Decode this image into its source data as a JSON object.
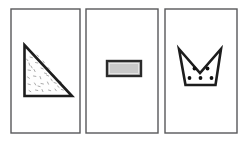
{
  "figure": {
    "background_color": "#ffffff",
    "panel_count": 3,
    "panel_border_color": "#58585a",
    "shape_stroke_color": "#1d1d1d",
    "panels": [
      {
        "index": 1,
        "shape_name": "right-triangle",
        "fill_label": "stippled",
        "fill_color": "#fefefe",
        "speck_color": "#9a9a9a",
        "vertices": "top-left, bottom-left, bottom-right",
        "dot_count": 0
      },
      {
        "index": 2,
        "shape_name": "horizontal-rectangle",
        "fill_label": "solid-gray",
        "fill_color": "#c9c9c9",
        "speck_color": "",
        "vertices": "four corners",
        "dot_count": 0
      },
      {
        "index": 3,
        "shape_name": "notched-cup",
        "fill_label": "white-with-dots",
        "fill_color": "#ffffff",
        "speck_color": "#101010",
        "vertices": "two peaks, center notch, tapered base",
        "dot_count": 5
      }
    ],
    "cup_dots": [
      {
        "cx": 194.5,
        "cy": 68.5,
        "r": 1.9
      },
      {
        "cx": 207.5,
        "cy": 68.5,
        "r": 1.9
      },
      {
        "cx": 189.5,
        "cy": 78.0,
        "r": 1.9
      },
      {
        "cx": 200.5,
        "cy": 78.0,
        "r": 1.9
      },
      {
        "cx": 211.5,
        "cy": 78.0,
        "r": 1.9
      }
    ]
  }
}
